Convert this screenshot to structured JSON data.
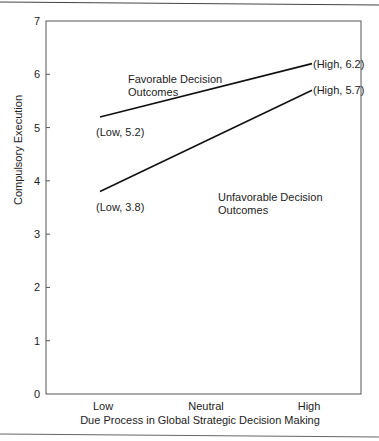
{
  "chart_data": {
    "type": "line",
    "title": "",
    "xlabel": "Due Process in Global Strategic Decision Making",
    "ylabel": "Compulsory Execution",
    "categories": [
      "Low",
      "Neutral",
      "High"
    ],
    "ylim": [
      0,
      7
    ],
    "yticks": [
      "0",
      "1",
      "2",
      "3",
      "4",
      "5",
      "6",
      "7"
    ],
    "grid": false,
    "legend": "none",
    "series": [
      {
        "name": "Favorable Decision Outcomes",
        "label_lines": [
          "Favorable Decision",
          "Outcomes"
        ],
        "points": [
          {
            "x": "Low",
            "y": 5.2,
            "label": "(Low, 5.2)"
          },
          {
            "x": "High",
            "y": 6.2,
            "label": "(High, 6.2)"
          }
        ]
      },
      {
        "name": "Unfavorable Decision Outcomes",
        "label_lines": [
          "Unfavorable Decision",
          "Outcomes"
        ],
        "points": [
          {
            "x": "Low",
            "y": 3.8,
            "label": "(Low, 3.8)"
          },
          {
            "x": "High",
            "y": 5.7,
            "label": "(High, 5.7)"
          }
        ]
      }
    ]
  }
}
